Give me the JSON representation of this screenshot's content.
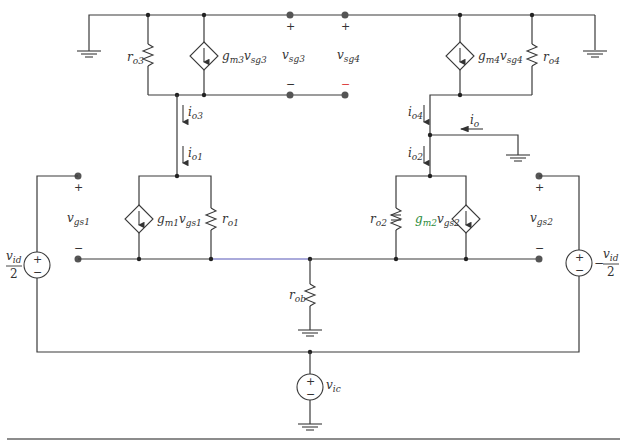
{
  "diagram": {
    "labels": {
      "ro3": {
        "main": "r",
        "sub": "o3"
      },
      "gm3": {
        "main": "g",
        "sub1": "m3",
        "v": "v",
        "sub2": "sg3"
      },
      "vsg3_left": {
        "main": "v",
        "sub": "sg3"
      },
      "vsg3": {
        "main": "v",
        "sub": "sg3"
      },
      "vsg4": {
        "main": "v",
        "sub": "sg4"
      },
      "gm4": {
        "main": "g",
        "sub1": "m4",
        "v": "v",
        "sub2": "sg4"
      },
      "ro4": {
        "main": "r",
        "sub": "o4"
      },
      "io3": {
        "main": "i",
        "sub": "o3"
      },
      "io1": {
        "main": "i",
        "sub": "o1"
      },
      "io4": {
        "main": "i",
        "sub": "o4"
      },
      "io2": {
        "main": "i",
        "sub": "o2"
      },
      "io": {
        "main": "i",
        "sub": "o"
      },
      "vgs1": {
        "main": "v",
        "sub": "gs1"
      },
      "gm1": {
        "main": "g",
        "sub1": "m1",
        "v": "v",
        "sub2": "gs1"
      },
      "ro1": {
        "main": "r",
        "sub": "o1"
      },
      "ro2": {
        "main": "r",
        "sub": "o2"
      },
      "gm2": {
        "main": "g",
        "sub1": "m2",
        "v": "v",
        "sub2": "gs2"
      },
      "vgs2": {
        "main": "v",
        "sub": "gs2"
      },
      "rob": {
        "main": "r",
        "sub": "ob"
      },
      "vic": {
        "main": "v",
        "sub": "ic"
      },
      "vid_left": {
        "num": "v",
        "num_sub": "id",
        "den": "2"
      },
      "vid_right": {
        "prefix": "−",
        "num": "v",
        "num_sub": "id",
        "den": "2"
      }
    },
    "signs": {
      "plus": "+",
      "minus": "−"
    },
    "colors": {
      "wire": "#3a3a3a",
      "highlight_wire": "#5656b8",
      "gm2_label": "#2a8a3a",
      "minus_sg4": "#d44444"
    }
  }
}
